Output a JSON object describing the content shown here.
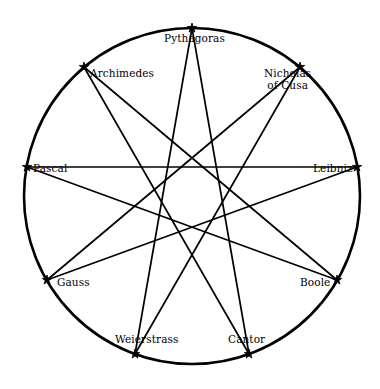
{
  "figure": {
    "title": "",
    "marker_glyph": "star",
    "stroke_color": "#000000",
    "background_color": "#ffffff",
    "circle": {
      "cx": 192,
      "cy": 196,
      "r": 168,
      "stroke_width": 2.6
    }
  },
  "chart_data": {
    "type": "diagram",
    "subtype": "star-polygon",
    "schlafli": "{9/4}",
    "vertex_count": 9,
    "skip": 4,
    "title": "",
    "xlabel": "",
    "ylabel": "",
    "grid": false,
    "legend": null,
    "categories": [
      "Pythagoras",
      "Nicholas of Cusa",
      "Leibniz",
      "Boole",
      "Cantor",
      "Weierstrass",
      "Gauss",
      "Pascal",
      "Archimedes"
    ],
    "nodes": [
      {
        "id": 0,
        "label": "Pythagoras",
        "label_lines": [
          "Pythagoras"
        ],
        "angle_deg": -90,
        "x": 192,
        "y": 28,
        "label_x": 164,
        "label_y": 33,
        "anchor": "start"
      },
      {
        "id": 1,
        "label": "Nicholas of Cusa",
        "label_lines": [
          "Nicholas",
          "of Cusa"
        ],
        "angle_deg": -50,
        "x": 300,
        "y": 67,
        "label_x": 264,
        "label_y": 68,
        "anchor": "start"
      },
      {
        "id": 2,
        "label": "Leibniz",
        "label_lines": [
          "Leibniz"
        ],
        "angle_deg": -10,
        "x": 357,
        "y": 167,
        "label_x": 313,
        "label_y": 163,
        "anchor": "start"
      },
      {
        "id": 3,
        "label": "Boole",
        "label_lines": [
          "Boole"
        ],
        "angle_deg": 30,
        "x": 337,
        "y": 280,
        "label_x": 300,
        "label_y": 277,
        "anchor": "start"
      },
      {
        "id": 4,
        "label": "Cantor",
        "label_lines": [
          "Cantor"
        ],
        "angle_deg": 70,
        "x": 249,
        "y": 354,
        "label_x": 228,
        "label_y": 334,
        "anchor": "start"
      },
      {
        "id": 5,
        "label": "Weierstrass",
        "label_lines": [
          "Weierstrass"
        ],
        "angle_deg": 110,
        "x": 135,
        "y": 354,
        "label_x": 115,
        "label_y": 334,
        "anchor": "start"
      },
      {
        "id": 6,
        "label": "Gauss",
        "label_lines": [
          "Gauss"
        ],
        "angle_deg": 150,
        "x": 47,
        "y": 280,
        "label_x": 57,
        "label_y": 277,
        "anchor": "start"
      },
      {
        "id": 7,
        "label": "Pascal",
        "label_lines": [
          "Pascal"
        ],
        "angle_deg": 190,
        "x": 27,
        "y": 167,
        "label_x": 33,
        "label_y": 163,
        "anchor": "start"
      },
      {
        "id": 8,
        "label": "Archimedes",
        "label_lines": [
          "Archimedes"
        ],
        "angle_deg": 230,
        "x": 84,
        "y": 67,
        "label_x": 90,
        "label_y": 68,
        "anchor": "start"
      }
    ],
    "edges": [
      {
        "from": 0,
        "to": 4,
        "from_label": "Pythagoras",
        "to_label": "Cantor"
      },
      {
        "from": 4,
        "to": 8,
        "from_label": "Cantor",
        "to_label": "Archimedes"
      },
      {
        "from": 8,
        "to": 3,
        "from_label": "Archimedes",
        "to_label": "Boole"
      },
      {
        "from": 3,
        "to": 7,
        "from_label": "Boole",
        "to_label": "Pascal"
      },
      {
        "from": 7,
        "to": 2,
        "from_label": "Pascal",
        "to_label": "Leibniz"
      },
      {
        "from": 2,
        "to": 6,
        "from_label": "Leibniz",
        "to_label": "Gauss"
      },
      {
        "from": 6,
        "to": 1,
        "from_label": "Gauss",
        "to_label": "Nicholas of Cusa"
      },
      {
        "from": 1,
        "to": 5,
        "from_label": "Nicholas of Cusa",
        "to_label": "Weierstrass"
      },
      {
        "from": 5,
        "to": 0,
        "from_label": "Weierstrass",
        "to_label": "Pythagoras"
      }
    ]
  }
}
